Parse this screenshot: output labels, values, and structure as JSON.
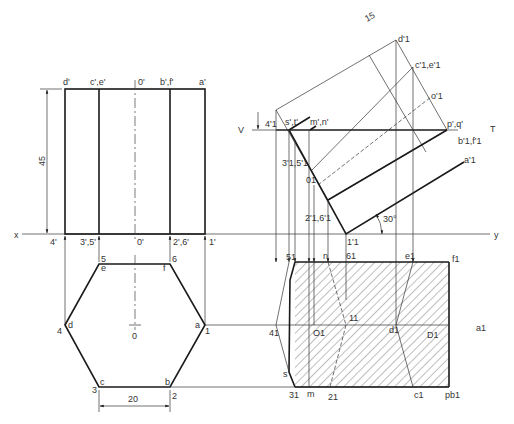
{
  "colors": {
    "line": "#1a1a1a",
    "thin": "#333333",
    "background": "#ffffff"
  },
  "dimensions": {
    "height": "45",
    "side": "20",
    "offset": "15",
    "angle": "30°"
  },
  "reference_line": {
    "x": "x",
    "y": "y"
  },
  "section_plane": {
    "v": "V",
    "t": "T"
  },
  "front_view": {
    "top_labels": [
      "d'",
      "c',e'",
      "0'",
      "b',f'",
      "a'"
    ],
    "bottom_labels": [
      "4'",
      "3',5'",
      "0'",
      "2',6'",
      "1'"
    ]
  },
  "top_view": {
    "corners": [
      "d",
      "c",
      "b",
      "a",
      "f",
      "e"
    ],
    "numbers": [
      "4",
      "3",
      "2",
      "1",
      "6",
      "5"
    ],
    "center": "0"
  },
  "auxiliary_view": {
    "labels": {
      "d1": "d'1",
      "c1e1": "c'1,e'1",
      "o1": "o'1",
      "pq": "p',q'",
      "b1f1": "b'1,f'1",
      "a1": "a'1",
      "st": "s',t'",
      "mn": "m',n'",
      "v4": "4'1",
      "v35": "3'1,5'1",
      "v0": "01",
      "v26": "2'1,6'1",
      "v1": "1'1"
    }
  },
  "section_view": {
    "labels": {
      "s5": "51",
      "n": "n",
      "s6": "61",
      "e1": "e1",
      "f1": "f1",
      "s4": "41",
      "o1": "O1",
      "s1": "11",
      "d1": "d1",
      "D1": "D1",
      "a1": "a1",
      "s": "s",
      "s3": "31",
      "m": "m",
      "s2": "21",
      "c1": "c1",
      "pb1": "pb1"
    }
  }
}
